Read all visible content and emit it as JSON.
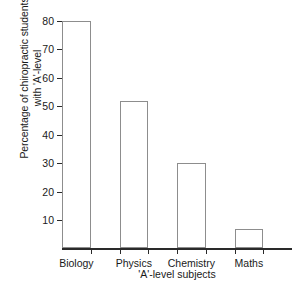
{
  "chart_data": {
    "type": "bar",
    "title": "",
    "categories": [
      "Biology",
      "Physics",
      "Chemistry",
      "Maths"
    ],
    "values": [
      80,
      52,
      30,
      7
    ],
    "xlabel": "'A'-level subjects",
    "ylabel_line1": "Percentage of chiropractic students",
    "ylabel_line2": "with 'A'-level",
    "ylim": [
      0,
      80
    ],
    "yticks": [
      10,
      20,
      30,
      40,
      50,
      60,
      70,
      80
    ],
    "ytick_labels": [
      "10",
      "20",
      "30",
      "40",
      "50",
      "60",
      "70",
      "80"
    ],
    "grid": false,
    "legend": null,
    "bar_fill_color": "#ffffff",
    "bar_edge_color": "#8d8d8d",
    "axis_color": "#2a2a2a",
    "background_color": "#ffffff"
  }
}
